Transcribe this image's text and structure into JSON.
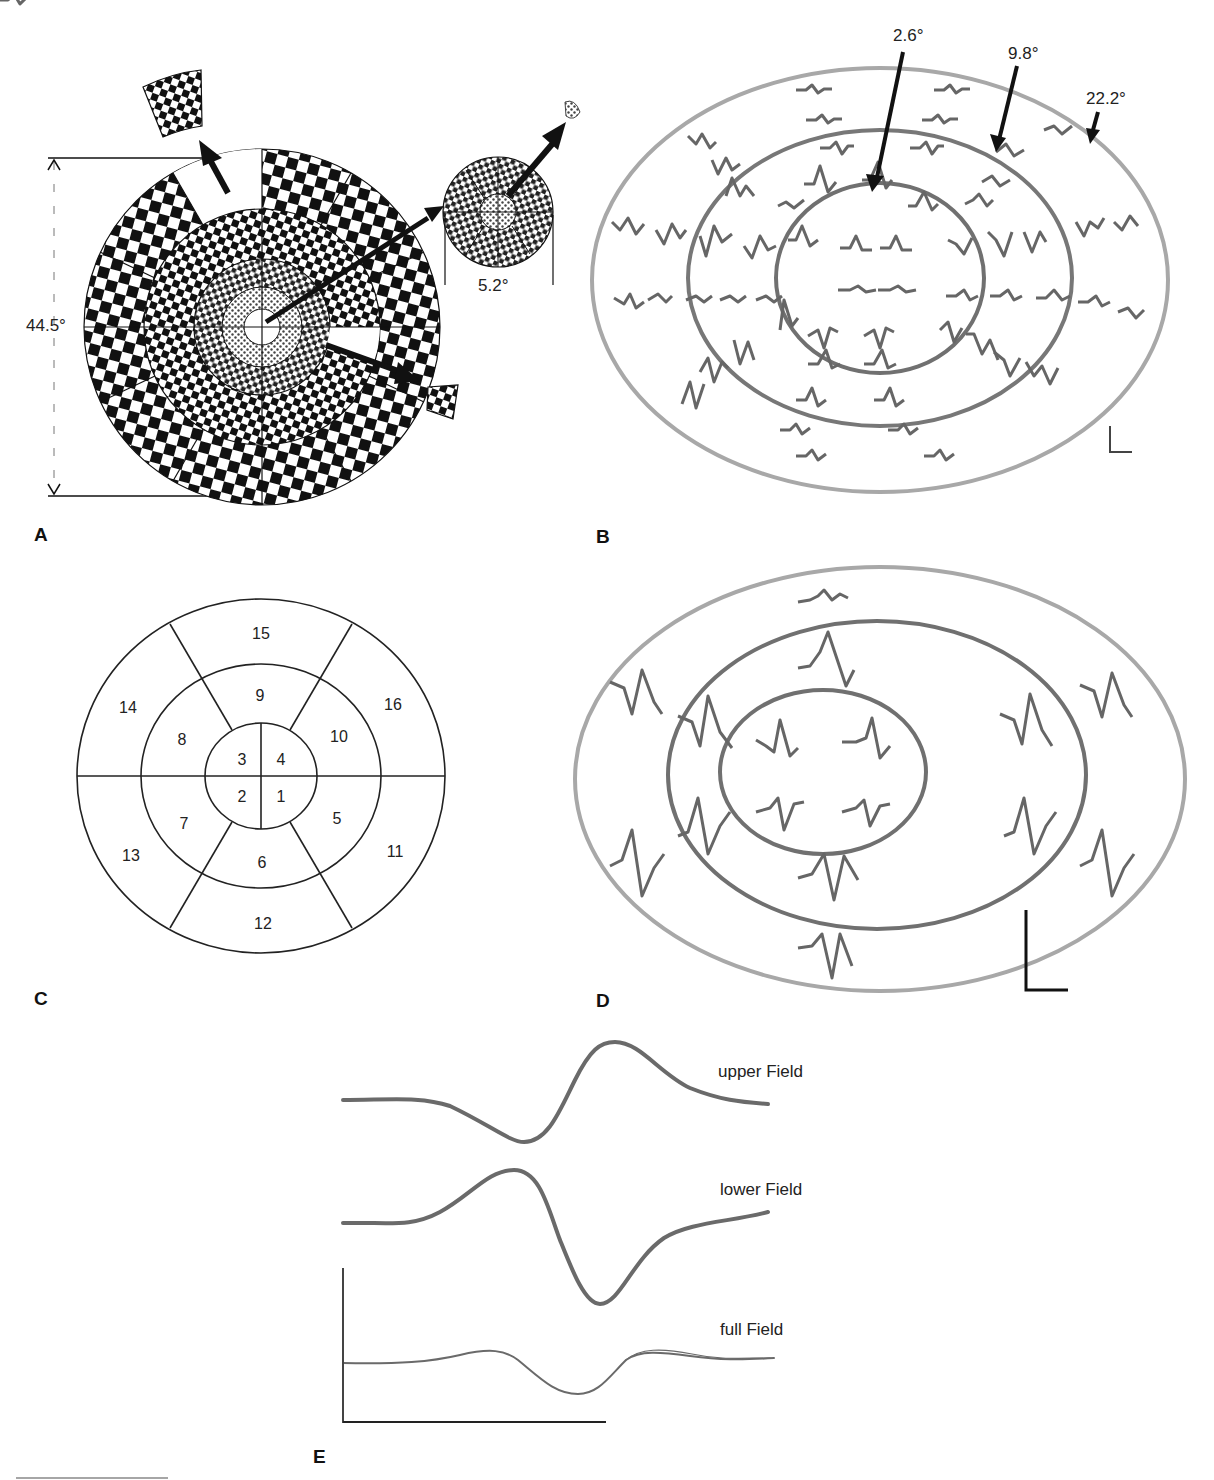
{
  "panels": {
    "A": {
      "letter": "A",
      "diameter_label": "44.5°",
      "center_stimulus_label": "5.2°",
      "description": "Dartboard checkerboard stimulus with 16 sectors; magnified insets of central, upper and right sectors"
    },
    "B": {
      "letter": "B",
      "ring_labels": [
        "2.6°",
        "9.8°",
        "22.2°"
      ],
      "description": "Trace array of multifocal responses within three concentric eccentricity rings"
    },
    "C": {
      "letter": "C",
      "segments": [
        "1",
        "2",
        "3",
        "4",
        "5",
        "6",
        "7",
        "8",
        "9",
        "10",
        "11",
        "12",
        "13",
        "14",
        "15",
        "16"
      ],
      "description": "Segment numbering map of the 16-sector stimulus"
    },
    "D": {
      "letter": "D",
      "description": "Summed responses per sector displayed in three concentric rings"
    },
    "E": {
      "letter": "E",
      "traces": [
        {
          "label": "upper Field"
        },
        {
          "label": "lower Field"
        },
        {
          "label": "full Field"
        }
      ]
    }
  },
  "colors": {
    "ink": "#111111",
    "trace": "#666666",
    "ring_outer": "#a8a8a8",
    "ring_inner": "#707070"
  }
}
